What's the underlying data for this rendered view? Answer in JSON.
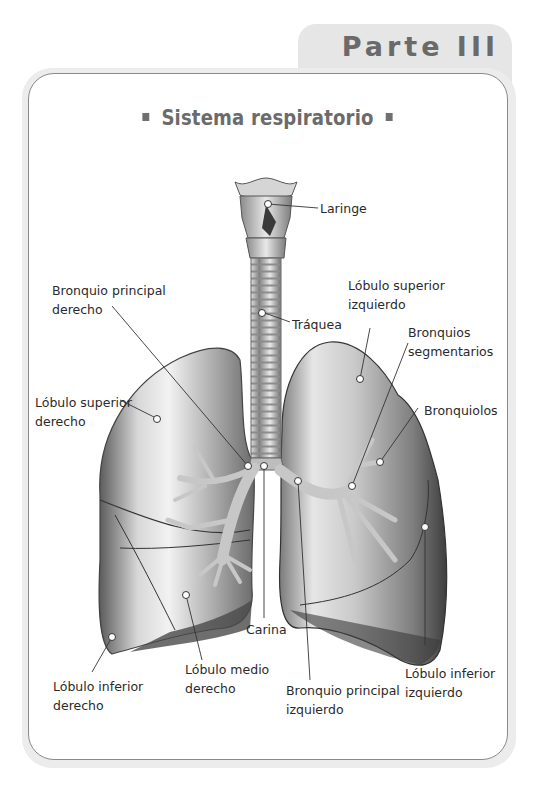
{
  "header": {
    "tab_label": "Parte III"
  },
  "figure": {
    "title": "Sistema respiratorio",
    "labels": {
      "laringe": "Laringe",
      "traquea": "Tráquea",
      "bronquio_principal_derecho_l1": "Bronquio  principal",
      "bronquio_principal_derecho_l2": "derecho",
      "lobulo_superior_derecho_l1": "Lóbulo superior",
      "lobulo_superior_derecho_l2": "derecho",
      "lobulo_superior_izquierdo_l1": "Lóbulo superior",
      "lobulo_superior_izquierdo_l2": "izquierdo",
      "bronquios_segmentarios_l1": "Bronquios",
      "bronquios_segmentarios_l2": "segmentarios",
      "bronquiolos": "Bronquiolos",
      "carina": "Carina",
      "lobulo_medio_derecho_l1": "Lóbulo medio",
      "lobulo_medio_derecho_l2": "derecho",
      "lobulo_inferior_derecho_l1": "Lóbulo inferior",
      "lobulo_inferior_derecho_l2": "derecho",
      "bronquio_principal_izquierdo_l1": "Bronquio principal",
      "bronquio_principal_izquierdo_l2": "izquierdo",
      "lobulo_inferior_izquierdo_l1": "Lóbulo inferior",
      "lobulo_inferior_izquierdo_l2": "izquierdo"
    }
  }
}
